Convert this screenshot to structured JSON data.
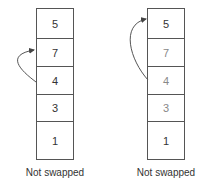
{
  "left": {
    "cells": [
      "5",
      "7",
      "4",
      "3",
      "1"
    ],
    "caption": "Not swapped",
    "arrow": {
      "from": "4",
      "to": "7"
    }
  },
  "right": {
    "cells": [
      "5",
      "7",
      "4",
      "3",
      "1"
    ],
    "caption": "Not swapped",
    "arrow": {
      "from": "4",
      "to": "5"
    }
  }
}
